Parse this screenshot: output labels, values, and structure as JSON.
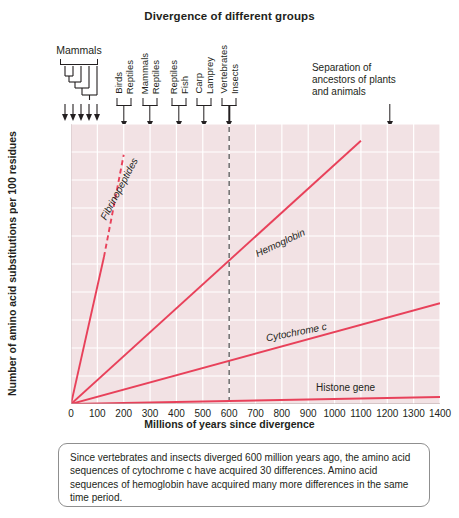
{
  "chart_data": {
    "type": "line",
    "title": "Divergence of different groups",
    "xlabel": "Millions of years since divergence",
    "ylabel": "Number of amino acid substitutions per 100 residues",
    "xlim": [
      0,
      1400
    ],
    "ylim": [
      0,
      200
    ],
    "xticks": [
      0,
      100,
      200,
      300,
      400,
      500,
      600,
      700,
      800,
      900,
      1000,
      1100,
      1200,
      1300,
      1400
    ],
    "yticks": [
      0,
      20,
      40,
      60,
      80,
      100,
      120,
      140,
      160,
      180,
      200
    ],
    "grid": true,
    "legend_position": "inline-labels",
    "line_color": "#e8415a",
    "plot_background": "#f2e2e4",
    "gridline_color": "#ffffff",
    "series": [
      {
        "name": "Fibrinopeptides",
        "x": [
          0,
          125,
          200
        ],
        "values": [
          0,
          105,
          178
        ],
        "style": "solid-then-dashed",
        "dash_start_x": 125,
        "label": "Fibrinopeptides",
        "label_x": 120,
        "label_y": 132,
        "label_rotation": -62
      },
      {
        "name": "Hemoglobin",
        "x": [
          0,
          1100
        ],
        "values": [
          0,
          188
        ],
        "style": "solid",
        "label": "Hemoglobin",
        "label_x": 700,
        "label_y": 107,
        "label_rotation": -25
      },
      {
        "name": "Cytochrome c",
        "x": [
          0,
          1400
        ],
        "values": [
          0,
          72
        ],
        "style": "solid",
        "label": "Cytochrome c",
        "label_x": 740,
        "label_y": 47,
        "label_rotation": -11
      },
      {
        "name": "Histone gene",
        "x": [
          0,
          1400
        ],
        "values": [
          0,
          5
        ],
        "style": "solid",
        "label": "Histone gene",
        "label_x": 930,
        "label_y": 12,
        "label_rotation": 0
      }
    ],
    "reference_line": {
      "name": "vertebrates-insects-divergence",
      "x": 600,
      "style": "dashed",
      "color": "#555555"
    },
    "annotations": [
      {
        "name": "mammals",
        "kind": "tree",
        "label": "Mammals",
        "x": 30,
        "arrow_count": 5
      },
      {
        "name": "birds-reptiles",
        "kind": "pair",
        "labels": [
          "Birds",
          "Reptiles"
        ],
        "x": 200
      },
      {
        "name": "mammals-reptiles",
        "kind": "pair",
        "labels": [
          "Mammals",
          "Reptiles"
        ],
        "x": 300
      },
      {
        "name": "reptiles-fish",
        "kind": "pair",
        "labels": [
          "Reptiles",
          "Fish"
        ],
        "x": 410
      },
      {
        "name": "carp-lamprey",
        "kind": "pair",
        "labels": [
          "Carp",
          "Lamprey"
        ],
        "x": 505
      },
      {
        "name": "vertebrates-insects",
        "kind": "pair",
        "labels": [
          "Vertebrates",
          "Insects"
        ],
        "x": 600
      },
      {
        "name": "separation-plants-animals",
        "kind": "text-arrow",
        "text": "Separation of\nancestors of plants\nand animals",
        "x": 1210
      }
    ]
  },
  "caption": {
    "text": "Since vertebrates and insects diverged 600 million years ago, the amino acid sequences of cytochrome c have acquired 30 differences. Amino acid sequences of hemoglobin have acquired many more differences in the same time period."
  }
}
